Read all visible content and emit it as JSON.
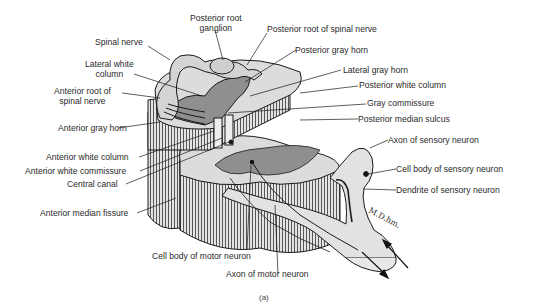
{
  "figure": {
    "caption": "(a)",
    "signature": "M.D.hm.",
    "colors": {
      "gray_matter": "#8f8f8f",
      "white_matter": "#dcdcdc",
      "outline": "#1a1a1a",
      "background": "#ffffff",
      "text": "#2a2a2a"
    }
  },
  "labels": {
    "posterior_root_ganglion_1": "Posterior root",
    "posterior_root_ganglion_2": "ganglion",
    "posterior_root_spinal_nerve": "Posterior root of spinal nerve",
    "spinal_nerve": "Spinal nerve",
    "posterior_gray_horn": "Posterior gray horn",
    "lateral_white_column_1": "Lateral white",
    "lateral_white_column_2": "column",
    "lateral_gray_horn": "Lateral gray horn",
    "anterior_root_1": "Anterior root of",
    "anterior_root_2": "spinal nerve",
    "posterior_white_column": "Posterior white column",
    "gray_commissure": "Gray commissure",
    "anterior_gray_horn": "Anterior gray horn",
    "posterior_median_sulcus": "Posterior median sulcus",
    "axon_sensory_neuron": "Axon of sensory neuron",
    "anterior_white_column": "Anterior white column",
    "anterior_white_commissure": "Anterior white commissure",
    "cell_body_sensory_neuron": "Cell body of sensory neuron",
    "central_canal": "Central canal",
    "dendrite_sensory_neuron": "Dendrite of sensory neuron",
    "anterior_median_fissure": "Anterior median fissure",
    "cell_body_motor_neuron": "Cell body of motor neuron",
    "axon_motor_neuron": "Axon of motor neuron"
  }
}
